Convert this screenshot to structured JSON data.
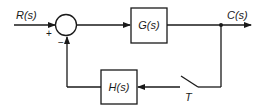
{
  "diagram": {
    "type": "block-diagram",
    "input_label": "R(s)",
    "output_label": "C(s)",
    "forward_block": {
      "label": "G(s)"
    },
    "feedback_block": {
      "label": "H(s)"
    },
    "summing_junction": {
      "plus_sign": "+",
      "minus_sign": "−"
    },
    "switch": {
      "label": "T"
    },
    "colors": {
      "line": "#1a1a1a",
      "background": "#ffffff"
    }
  }
}
